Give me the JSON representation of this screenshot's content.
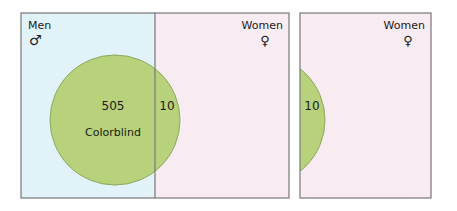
{
  "colors": {
    "men_bg": "#e1f3f8",
    "women_bg": "#f8ebf2",
    "circle_fill": "#b7d27a",
    "circle_stroke": "#8aa85a",
    "border": "#777777"
  },
  "left_panel": {
    "men_label": "Men",
    "men_symbol": "♂",
    "women_label": "Women",
    "women_symbol": "♀",
    "men_count": "505",
    "women_count": "10",
    "circle_label": "Colorblind"
  },
  "right_panel": {
    "women_label": "Women",
    "women_symbol": "♀",
    "count": "10"
  }
}
